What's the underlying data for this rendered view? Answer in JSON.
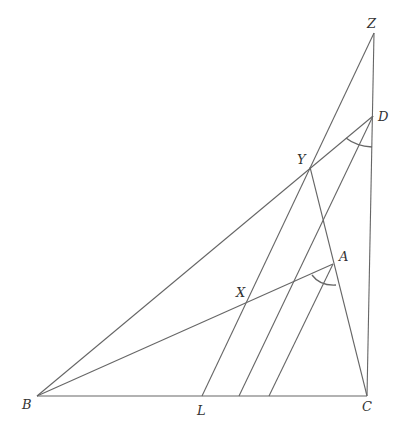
{
  "diagram": {
    "type": "geometry-figure",
    "stroke_color": "#666666",
    "points": {
      "Z": {
        "label": "Z",
        "x": 374,
        "y": 33,
        "lx": 367,
        "ly": 17
      },
      "D": {
        "label": "D",
        "x": 373,
        "y": 116,
        "lx": 378,
        "ly": 110
      },
      "Y": {
        "label": "Y",
        "x": 310,
        "y": 167,
        "lx": 296,
        "ly": 153
      },
      "A": {
        "label": "A",
        "x": 333,
        "y": 264,
        "lx": 339,
        "ly": 250
      },
      "X": {
        "label": "X",
        "x": 248,
        "y": 300,
        "lx": 235,
        "ly": 286
      },
      "B": {
        "label": "B",
        "x": 37,
        "y": 396,
        "lx": 22,
        "ly": 398
      },
      "L": {
        "label": "L",
        "x": 202,
        "y": 396,
        "lx": 196,
        "ly": 404
      },
      "C": {
        "label": "C",
        "x": 367,
        "y": 396,
        "lx": 362,
        "ly": 400
      },
      "P1": {
        "label": "",
        "x": 239,
        "y": 396
      },
      "P2": {
        "label": "",
        "x": 269,
        "y": 396
      }
    },
    "segments": [
      [
        "B",
        "C"
      ],
      [
        "B",
        "D"
      ],
      [
        "B",
        "A"
      ],
      [
        "L",
        "Z"
      ],
      [
        "Z",
        "C"
      ],
      [
        "C",
        "Y"
      ],
      [
        "P1",
        "D"
      ],
      [
        "P2",
        "A"
      ]
    ],
    "angle_marks": [
      {
        "at": "D",
        "description": "arc between DB and DC"
      },
      {
        "at": "A",
        "description": "arc between AB and AP2"
      }
    ]
  }
}
